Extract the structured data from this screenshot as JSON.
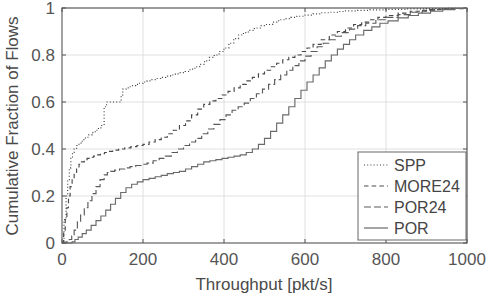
{
  "chart_data": {
    "type": "line",
    "title": "",
    "subtitle": "",
    "xlabel": "Throughput [pkt/s]",
    "ylabel": "Cumulative Fraction of Flows",
    "xlim": [
      0,
      1000
    ],
    "ylim": [
      0,
      1
    ],
    "xticks": [
      0,
      200,
      400,
      600,
      800,
      1000
    ],
    "xticklabels": [
      "0",
      "200",
      "400",
      "600",
      "800",
      "1000"
    ],
    "yticks": [
      0,
      0.2,
      0.4,
      0.6,
      0.8,
      1
    ],
    "yticklabels": [
      "0",
      "0.2",
      "0.4",
      "0.6",
      "0.8",
      "1"
    ],
    "grid": true,
    "legend_position": "lower right",
    "annotations": [],
    "series": [
      {
        "name": "SPP",
        "linestyle": "dotted",
        "color": "#3c3c3c",
        "x": [
          0,
          5,
          10,
          14,
          18,
          22,
          26,
          30,
          36,
          42,
          50,
          58,
          66,
          74,
          82,
          90,
          98,
          104,
          110,
          120,
          130,
          140,
          143,
          146,
          150,
          158,
          166,
          174,
          182,
          190,
          200,
          210,
          220,
          232,
          244,
          256,
          268,
          280,
          292,
          304,
          316,
          328,
          340,
          352,
          364,
          376,
          388,
          400,
          412,
          424,
          436,
          448,
          460,
          475,
          490,
          505,
          520,
          535,
          550,
          565,
          580,
          600,
          620,
          640,
          660,
          680,
          700,
          730,
          760,
          800,
          850,
          900,
          950,
          1000
        ],
        "y": [
          0.0,
          0.1,
          0.2,
          0.27,
          0.32,
          0.36,
          0.385,
          0.4,
          0.415,
          0.425,
          0.44,
          0.45,
          0.46,
          0.47,
          0.48,
          0.49,
          0.5,
          0.58,
          0.6,
          0.6,
          0.6,
          0.6,
          0.6,
          0.63,
          0.655,
          0.66,
          0.665,
          0.67,
          0.675,
          0.68,
          0.685,
          0.69,
          0.695,
          0.7,
          0.705,
          0.71,
          0.715,
          0.72,
          0.725,
          0.73,
          0.74,
          0.75,
          0.76,
          0.775,
          0.79,
          0.8,
          0.815,
          0.83,
          0.85,
          0.87,
          0.885,
          0.895,
          0.905,
          0.915,
          0.925,
          0.93,
          0.94,
          0.95,
          0.955,
          0.96,
          0.965,
          0.97,
          0.975,
          0.98,
          0.982,
          0.985,
          0.988,
          0.99,
          0.992,
          0.994,
          0.996,
          0.998,
          0.999,
          1.0
        ]
      },
      {
        "name": "MORE24",
        "linestyle": "dashed",
        "color": "#4a4a4a",
        "x": [
          0,
          4,
          8,
          12,
          16,
          20,
          25,
          30,
          36,
          42,
          48,
          55,
          62,
          70,
          78,
          86,
          95,
          105,
          115,
          125,
          140,
          155,
          170,
          185,
          200,
          215,
          230,
          245,
          260,
          275,
          290,
          305,
          320,
          335,
          350,
          365,
          380,
          395,
          410,
          425,
          440,
          455,
          470,
          485,
          500,
          515,
          530,
          545,
          560,
          575,
          590,
          605,
          620,
          640,
          660,
          680,
          700,
          720,
          740,
          760,
          780,
          800,
          830,
          860,
          900,
          940,
          1000
        ],
        "y": [
          0.0,
          0.05,
          0.1,
          0.15,
          0.2,
          0.24,
          0.275,
          0.3,
          0.32,
          0.335,
          0.345,
          0.355,
          0.36,
          0.365,
          0.37,
          0.375,
          0.38,
          0.385,
          0.39,
          0.395,
          0.4,
          0.405,
          0.41,
          0.415,
          0.42,
          0.43,
          0.44,
          0.45,
          0.465,
          0.48,
          0.5,
          0.52,
          0.545,
          0.57,
          0.59,
          0.605,
          0.615,
          0.63,
          0.645,
          0.66,
          0.675,
          0.69,
          0.705,
          0.72,
          0.735,
          0.75,
          0.765,
          0.78,
          0.79,
          0.8,
          0.815,
          0.83,
          0.845,
          0.865,
          0.885,
          0.9,
          0.915,
          0.93,
          0.94,
          0.95,
          0.96,
          0.968,
          0.978,
          0.986,
          0.993,
          0.997,
          1.0
        ]
      },
      {
        "name": "POR24",
        "linestyle": "dashdot",
        "color": "#5a5a5a",
        "x": [
          0,
          10,
          18,
          24,
          30,
          38,
          46,
          55,
          64,
          74,
          84,
          94,
          104,
          112,
          120,
          130,
          142,
          155,
          168,
          182,
          196,
          210,
          225,
          240,
          255,
          270,
          285,
          300,
          315,
          330,
          345,
          360,
          375,
          390,
          405,
          420,
          435,
          450,
          465,
          480,
          495,
          510,
          525,
          540,
          555,
          570,
          585,
          600,
          615,
          630,
          645,
          660,
          675,
          690,
          710,
          730,
          750,
          775,
          800,
          830,
          860,
          890,
          920,
          960,
          1000
        ],
        "y": [
          0.0,
          0.005,
          0.015,
          0.03,
          0.055,
          0.09,
          0.12,
          0.15,
          0.18,
          0.21,
          0.24,
          0.27,
          0.29,
          0.3,
          0.305,
          0.31,
          0.315,
          0.32,
          0.325,
          0.33,
          0.335,
          0.34,
          0.35,
          0.36,
          0.37,
          0.385,
          0.4,
          0.415,
          0.43,
          0.445,
          0.465,
          0.485,
          0.505,
          0.525,
          0.545,
          0.565,
          0.58,
          0.595,
          0.615,
          0.635,
          0.655,
          0.675,
          0.695,
          0.715,
          0.735,
          0.755,
          0.775,
          0.795,
          0.815,
          0.835,
          0.85,
          0.865,
          0.88,
          0.895,
          0.91,
          0.925,
          0.935,
          0.95,
          0.96,
          0.972,
          0.982,
          0.99,
          0.995,
          0.998,
          1.0
        ]
      },
      {
        "name": "POR",
        "linestyle": "solid",
        "color": "#6a6a6a",
        "x": [
          0,
          15,
          25,
          32,
          40,
          50,
          60,
          72,
          84,
          96,
          108,
          120,
          132,
          145,
          158,
          172,
          186,
          200,
          215,
          230,
          245,
          260,
          275,
          290,
          305,
          320,
          335,
          350,
          365,
          380,
          395,
          410,
          425,
          440,
          455,
          470,
          485,
          500,
          515,
          530,
          545,
          560,
          575,
          590,
          605,
          620,
          635,
          650,
          665,
          680,
          695,
          710,
          725,
          745,
          765,
          785,
          805,
          830,
          855,
          880,
          910,
          940,
          970,
          1000
        ],
        "y": [
          0.0,
          0.0,
          0.005,
          0.015,
          0.025,
          0.04,
          0.055,
          0.075,
          0.095,
          0.115,
          0.14,
          0.165,
          0.19,
          0.215,
          0.235,
          0.25,
          0.26,
          0.27,
          0.275,
          0.282,
          0.288,
          0.295,
          0.3,
          0.305,
          0.315,
          0.325,
          0.335,
          0.345,
          0.35,
          0.355,
          0.36,
          0.365,
          0.37,
          0.375,
          0.385,
          0.4,
          0.42,
          0.445,
          0.475,
          0.51,
          0.545,
          0.58,
          0.615,
          0.65,
          0.685,
          0.715,
          0.745,
          0.775,
          0.8,
          0.825,
          0.845,
          0.865,
          0.885,
          0.905,
          0.92,
          0.935,
          0.945,
          0.958,
          0.968,
          0.978,
          0.986,
          0.993,
          0.998,
          1.0
        ]
      }
    ]
  },
  "legend": {
    "items": [
      {
        "label": "SPP"
      },
      {
        "label": "MORE24"
      },
      {
        "label": "POR24"
      },
      {
        "label": "POR"
      }
    ]
  },
  "colors": {
    "axis": "#555555",
    "grid": "#d8d8d8",
    "background": "#ffffff",
    "text": "#4a4a4a"
  }
}
